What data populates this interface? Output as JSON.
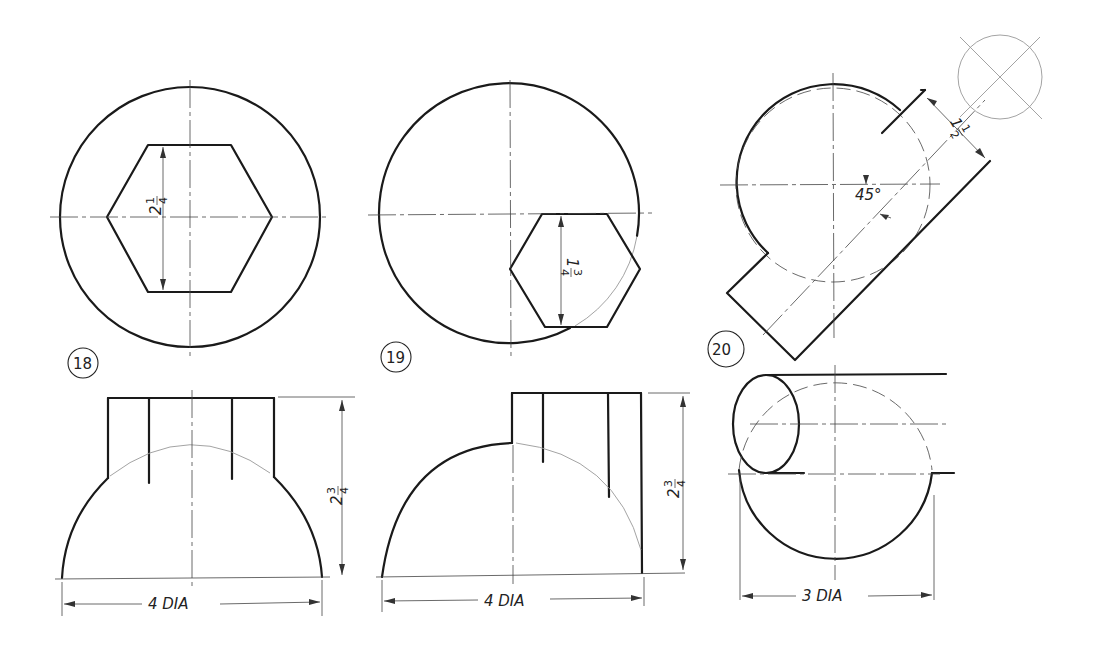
{
  "figures": [
    {
      "number": "18",
      "top_view": {
        "shape": "circle with centered hexagon",
        "hex_dimension": {
          "whole": "2",
          "numerator": "1",
          "denominator": "4",
          "text": "2 1/4"
        }
      },
      "front_view": {
        "height_dimension": {
          "whole": "2",
          "numerator": "3",
          "denominator": "4",
          "text": "2 3/4"
        },
        "width_dimension": "4 DIA"
      }
    },
    {
      "number": "19",
      "top_view": {
        "shape": "circle with offset hexagon",
        "hex_dimension": {
          "whole": "1",
          "numerator": "3",
          "denominator": "4",
          "text": "1 3/4"
        }
      },
      "front_view": {
        "height_dimension": {
          "whole": "2",
          "numerator": "3",
          "denominator": "4",
          "text": "2 3/4"
        },
        "width_dimension": "4 DIA"
      }
    },
    {
      "number": "20",
      "top_view": {
        "shape": "circle with 45° cylinder",
        "cylinder_dimension": {
          "whole": "1",
          "numerator": "1",
          "denominator": "2",
          "text": "1 1/2"
        },
        "angle": "45°"
      },
      "front_view": {
        "width_dimension": "3 DIA"
      }
    }
  ]
}
